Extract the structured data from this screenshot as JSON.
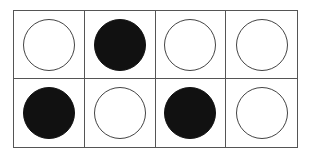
{
  "ten_frame": {
    "rows": 2,
    "columns": 4,
    "cells": [
      {
        "state": "empty"
      },
      {
        "state": "filled"
      },
      {
        "state": "empty"
      },
      {
        "state": "empty"
      },
      {
        "state": "filled"
      },
      {
        "state": "empty"
      },
      {
        "state": "filled"
      },
      {
        "state": "empty"
      }
    ],
    "filled_count": 3,
    "total_cells": 8,
    "colors": {
      "filled": "#111111",
      "empty_outline": "#444444",
      "grid_line": "#555555"
    }
  }
}
